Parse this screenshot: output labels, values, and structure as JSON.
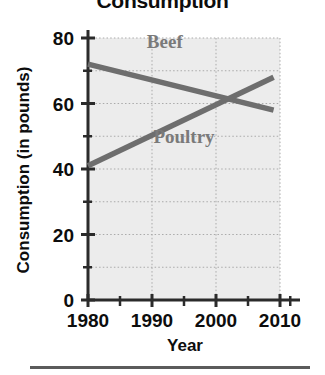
{
  "chart_data": {
    "type": "line",
    "title": "Consumption",
    "xlabel": "Year",
    "ylabel": "Consumption (in pounds)",
    "xlim": [
      1980,
      2010
    ],
    "ylim": [
      0,
      80
    ],
    "grid": true,
    "legend_position": "inline-annotations",
    "x_ticks": [
      1980,
      1990,
      2000,
      2010
    ],
    "x_minor_ticks": [
      1985,
      1995,
      2005
    ],
    "y_ticks": [
      0,
      20,
      40,
      60,
      80
    ],
    "y_minor_ticks": [
      10,
      30,
      50,
      70
    ],
    "series": [
      {
        "name": "Beef",
        "color": "#6e6e6e",
        "x": [
          1980,
          2009
        ],
        "values": [
          72,
          58
        ]
      },
      {
        "name": "Poultry",
        "color": "#6e6e6e",
        "x": [
          1980,
          2009
        ],
        "values": [
          41,
          68
        ]
      }
    ],
    "annotations": [
      {
        "text": "Beef",
        "x": 1992,
        "y": 77
      },
      {
        "text": "Poultry",
        "x": 1995,
        "y": 48
      }
    ],
    "intersection": {
      "x": 2002,
      "y": 61
    },
    "plot_background": "#ececec",
    "gridline_color": "#aaaaaa",
    "axis_color": "#2b2b2b"
  },
  "axis": {
    "x_tick_labels": [
      "1980",
      "1990",
      "2000",
      "2010"
    ],
    "y_tick_labels": [
      "0",
      "20",
      "40",
      "60",
      "80"
    ]
  },
  "labels": {
    "beef": "Beef",
    "poultry": "Poultry"
  }
}
